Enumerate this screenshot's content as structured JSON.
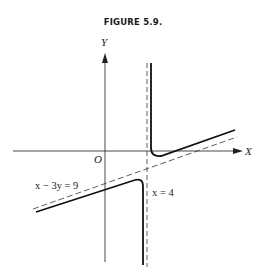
{
  "figure": {
    "title": "FIGURE 5.9.",
    "axes": {
      "x_label": "X",
      "y_label": "Y",
      "origin_label": "O"
    },
    "asymptotes": [
      {
        "label": "x − 3y = 9",
        "type": "oblique",
        "style": "dashed"
      },
      {
        "label": "x = 4",
        "type": "vertical",
        "style": "dashed"
      }
    ],
    "curve": {
      "description": "Hyperbola-like curve with two branches approaching asymptotes x = 4 and x − 3y = 9",
      "branches": [
        "upper-right",
        "lower-left"
      ]
    },
    "colors": {
      "ink": "#1a1a1a",
      "background": "#ffffff"
    }
  }
}
